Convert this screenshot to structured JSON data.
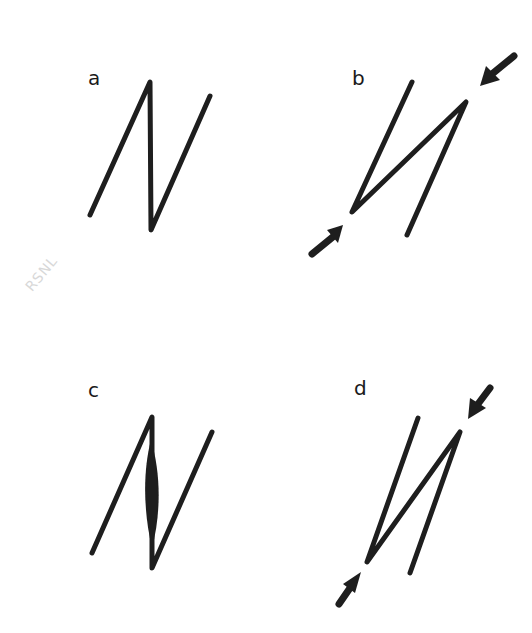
{
  "panels": [
    {
      "id": "a",
      "label": "a",
      "description": "N-shaped fold (open zigzag)"
    },
    {
      "id": "b",
      "label": "b",
      "description": "Zigzag under opposing compression arrows"
    },
    {
      "id": "c",
      "label": "c",
      "description": "N-shaped fold with filled lens in middle limb"
    },
    {
      "id": "d",
      "label": "d",
      "description": "Tightened zigzag under opposing compression arrows"
    }
  ],
  "watermark": "RSNL",
  "colors": {
    "ink": "#1e1e1e",
    "background": "#ffffff",
    "watermark": "#d8d8d8"
  }
}
